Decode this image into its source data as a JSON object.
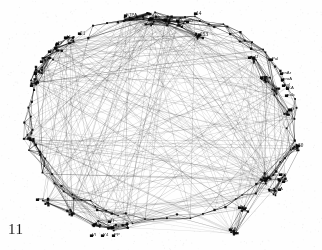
{
  "figure": {
    "number": "11",
    "type": "network-graph",
    "caption_position": "bottom-left",
    "background_color": "#fefefe",
    "ink_color": "#1a1a1a"
  },
  "chart_data": {
    "type": "scatter",
    "title": "",
    "subtitle": "",
    "xlabel": "",
    "ylabel": "",
    "grid": false,
    "legend": null,
    "layout": "circular-perimeter-network",
    "axis_visible": false,
    "tick_labels": [],
    "annotations": [
      {
        "text": "11",
        "x": 12,
        "y": 230,
        "role": "figure-number"
      }
    ],
    "nodes": [
      {
        "id": "n1",
        "label": "STPA",
        "x": 126,
        "y": 16
      },
      {
        "id": "n2",
        "label": "TBS",
        "x": 152,
        "y": 19
      },
      {
        "id": "n3",
        "label": "TBI",
        "x": 166,
        "y": 20
      },
      {
        "id": "n4",
        "label": "SL",
        "x": 178,
        "y": 21
      },
      {
        "id": "n5",
        "label": "z0",
        "x": 188,
        "y": 22
      },
      {
        "id": "n6",
        "label": "14",
        "x": 196,
        "y": 14
      },
      {
        "id": "n7",
        "label": "253",
        "x": 200,
        "y": 35
      },
      {
        "id": "n8",
        "label": "11",
        "x": 66,
        "y": 38
      },
      {
        "id": "n9",
        "label": "21",
        "x": 80,
        "y": 34
      },
      {
        "id": "n10",
        "label": "PI",
        "x": 58,
        "y": 44
      },
      {
        "id": "n11",
        "label": "SP",
        "x": 50,
        "y": 52
      },
      {
        "id": "n12",
        "label": "KP",
        "x": 42,
        "y": 62
      },
      {
        "id": "n13",
        "label": "Po",
        "x": 36,
        "y": 74
      },
      {
        "id": "n14",
        "label": "pd",
        "x": 32,
        "y": 86
      },
      {
        "id": "n15",
        "label": "palJ",
        "x": 250,
        "y": 58
      },
      {
        "id": "n16",
        "label": "Pal",
        "x": 272,
        "y": 60
      },
      {
        "id": "n17",
        "label": "pl",
        "x": 262,
        "y": 78
      },
      {
        "id": "n18",
        "label": "pnAr",
        "x": 282,
        "y": 74
      },
      {
        "id": "n19",
        "label": "proA",
        "x": 283,
        "y": 80
      },
      {
        "id": "n20",
        "label": "pgl",
        "x": 284,
        "y": 86
      },
      {
        "id": "n21",
        "label": "KA",
        "x": 288,
        "y": 89
      },
      {
        "id": "n22",
        "label": "palc",
        "x": 287,
        "y": 96
      },
      {
        "id": "n23",
        "label": "G",
        "x": 291,
        "y": 110
      },
      {
        "id": "n24",
        "label": "30",
        "x": 298,
        "y": 146
      },
      {
        "id": "n25",
        "label": "av",
        "x": 281,
        "y": 175
      },
      {
        "id": "n26",
        "label": "ar",
        "x": 284,
        "y": 182
      },
      {
        "id": "n27",
        "label": "A",
        "x": 280,
        "y": 190
      },
      {
        "id": "n28",
        "label": "24",
        "x": 240,
        "y": 208
      },
      {
        "id": "n29",
        "label": "36",
        "x": 231,
        "y": 230
      },
      {
        "id": "n30",
        "label": "vor",
        "x": 38,
        "y": 200
      },
      {
        "id": "n31",
        "label": "TI",
        "x": 110,
        "y": 222
      },
      {
        "id": "n32",
        "label": "PO",
        "x": 113,
        "y": 228
      },
      {
        "id": "n33",
        "label": "VI",
        "x": 92,
        "y": 236
      },
      {
        "id": "n34",
        "label": "Y4",
        "x": 103,
        "y": 236
      },
      {
        "id": "n35",
        "label": "PP",
        "x": 114,
        "y": 236
      }
    ],
    "node_count": 120,
    "edge_count": 420
  }
}
